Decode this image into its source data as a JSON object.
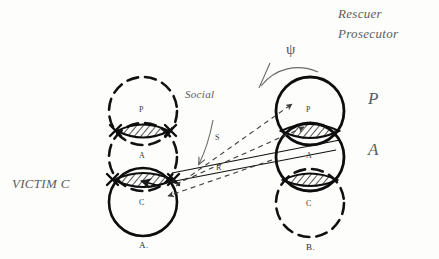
{
  "diagram": {
    "title_annotations": {
      "rescuer": "Rescuer",
      "prosecutor": "Prosecutor",
      "social": "Social",
      "victim": "VICTIM C",
      "psi_symbol": "ψ"
    },
    "side_labels": {
      "p": "P",
      "a": "A"
    },
    "edge_labels": {
      "s": "S",
      "r": "R"
    },
    "panels": [
      {
        "id": "panel-a",
        "caption": "A.",
        "circles": [
          {
            "label": "P",
            "style": "dashed"
          },
          {
            "label": "A",
            "style": "dashed"
          },
          {
            "label": "C",
            "style": "solid"
          }
        ],
        "overlaps": [
          {
            "between": "P-A",
            "hatched": true,
            "x_marks": true
          },
          {
            "between": "A-C",
            "hatched": true,
            "x_marks": true
          }
        ]
      },
      {
        "id": "panel-b",
        "caption": "B.",
        "circles": [
          {
            "label": "P",
            "style": "solid"
          },
          {
            "label": "A",
            "style": "solid"
          },
          {
            "label": "C",
            "style": "dashed"
          }
        ],
        "overlaps": [
          {
            "between": "P-A",
            "hatched": true,
            "x_marks": false
          },
          {
            "between": "A-C",
            "hatched": true,
            "x_marks": false
          }
        ]
      }
    ],
    "colors": {
      "ink": "#1a1a1a",
      "pencil": "#5a5a5a",
      "paper": "#fdfdfc"
    }
  }
}
